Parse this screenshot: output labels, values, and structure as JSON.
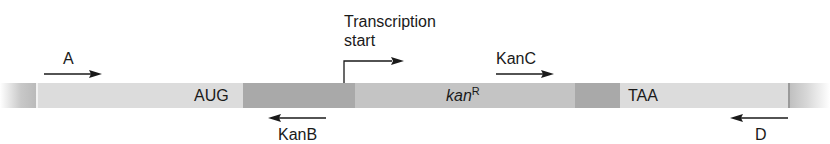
{
  "diagram": {
    "primers": [
      {
        "name": "A",
        "direction": "right"
      },
      {
        "name": "KanB",
        "direction": "left"
      },
      {
        "name": "KanC",
        "direction": "right"
      },
      {
        "name": "D",
        "direction": "left"
      }
    ],
    "transcription_start": {
      "line1": "Transcription",
      "line2": "start"
    },
    "bar_labels": {
      "start_codon": "AUG",
      "gene_italic": "kan",
      "gene_superscript": "R",
      "stop_codon": "TAA"
    },
    "colors": {
      "light_segment": "#dcdcdc",
      "dark_segment": "#a9a9a9",
      "medium_segment": "#c4c4c4",
      "arrow": "#1a1a1a"
    }
  }
}
